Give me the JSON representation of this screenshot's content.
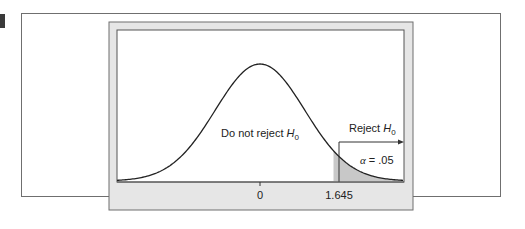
{
  "figure": {
    "labels": {
      "do_not_reject": "Do not reject ",
      "reject": "Reject ",
      "h": "H",
      "h_sub": "0",
      "alpha_symbol": "α",
      "alpha_eq": " = .05"
    },
    "ticks": [
      {
        "value": "0"
      },
      {
        "value": "1.645"
      }
    ],
    "colors": {
      "panel_bevel": "#e6e6e6",
      "shaded_region": "#c8c8c8",
      "curve": "#222222",
      "frame": "#6f6f6f"
    }
  },
  "chart_data": {
    "type": "area",
    "title": "",
    "x_ticks": [
      "0",
      "1.645"
    ],
    "critical_value": 1.645,
    "alpha": 0.05,
    "regions": [
      {
        "label": "Do not reject H0",
        "x_range": [
          -3.2,
          1.645
        ]
      },
      {
        "label": "Reject H0",
        "x_range": [
          1.645,
          3.2
        ],
        "shaded": true,
        "area": 0.05
      }
    ],
    "annotations": [
      "Do not reject H0",
      "Reject H0",
      "α = .05"
    ],
    "xlim": [
      -3.2,
      3.2
    ],
    "grid": false
  }
}
